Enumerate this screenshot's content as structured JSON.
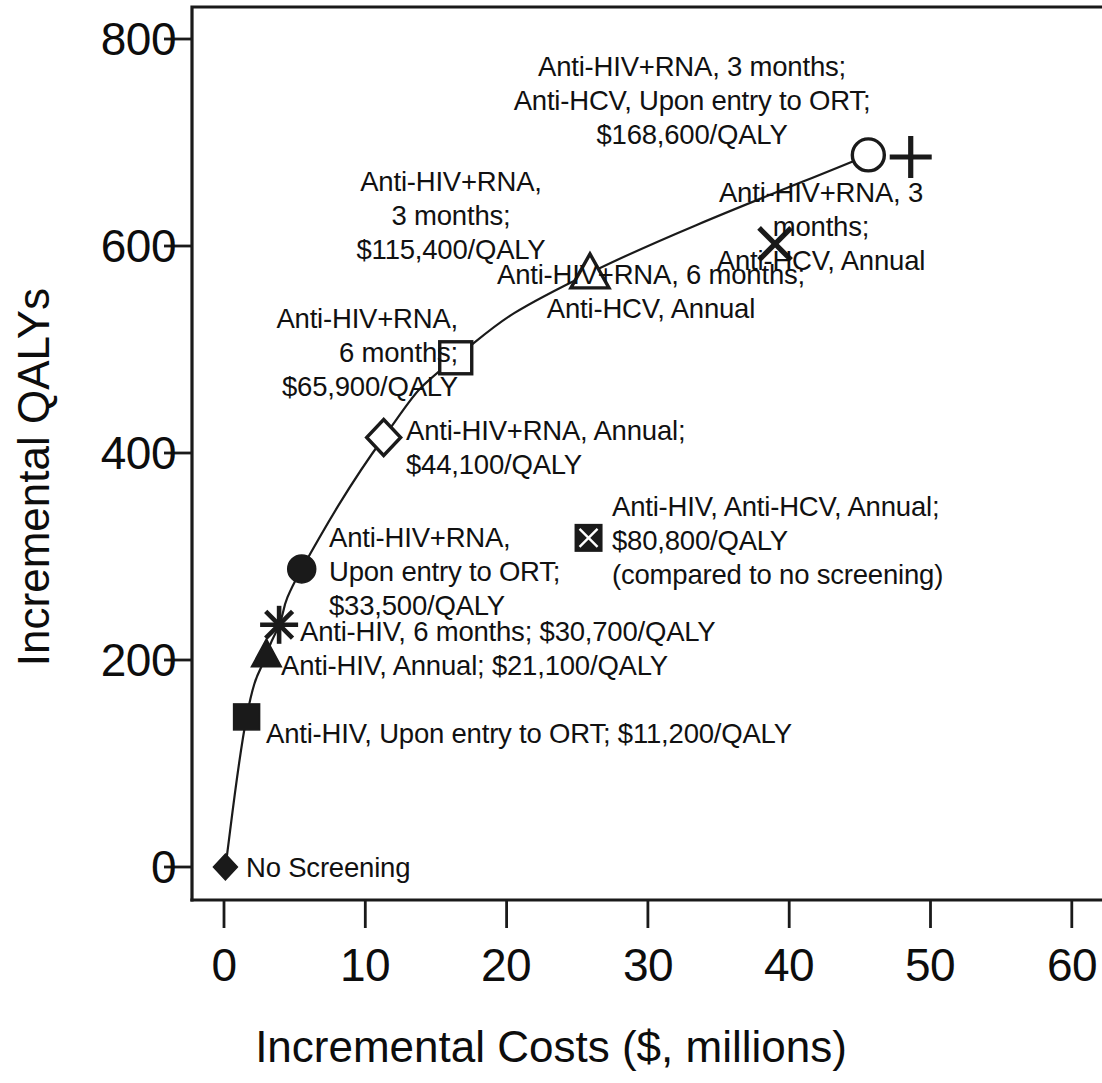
{
  "chart_data": {
    "type": "scatter",
    "title": "",
    "xlabel": "Incremental Costs ($, millions)",
    "ylabel": "Incremental QALYs",
    "xlim": [
      -1.8,
      62.2
    ],
    "ylim": [
      -25,
      838
    ],
    "xticks": [
      "0",
      "10",
      "20",
      "30",
      "40",
      "50",
      "60"
    ],
    "xtick_values": [
      0,
      10,
      20,
      30,
      40,
      50,
      60
    ],
    "yticks": [
      "0",
      "200",
      "400",
      "600",
      "800"
    ],
    "ytick_values": [
      0,
      200,
      400,
      600,
      800
    ],
    "grid": false,
    "legend": false,
    "frontier_note": "Points connected by the line form the efficient frontier; off-frontier strategies are plotted without connection.",
    "points": [
      {
        "id": "no-screening",
        "marker": "filled-diamond",
        "on_frontier": true,
        "x": 0.1,
        "y": 0,
        "strategy": "No Screening",
        "icer": "",
        "label": "No Screening",
        "label_align": "left",
        "label_x": 246,
        "label_y": 851
      },
      {
        "id": "anti-hiv-ort",
        "marker": "filled-square",
        "on_frontier": true,
        "x": 1.6,
        "y": 145,
        "strategy": "Anti-HIV, Upon entry to ORT",
        "icer": "$11,200/QALY",
        "label": "Anti-HIV, Upon entry to ORT; $11,200/QALY",
        "label_align": "left",
        "label_x": 266,
        "label_y": 717
      },
      {
        "id": "anti-hiv-annual",
        "marker": "filled-triangle",
        "on_frontier": true,
        "x": 3.0,
        "y": 205,
        "strategy": "Anti-HIV, Annual",
        "icer": "$21,100/QALY",
        "label": "Anti-HIV, Annual; $21,100/QALY",
        "label_align": "left",
        "label_x": 281,
        "label_y": 649
      },
      {
        "id": "anti-hiv-6mo",
        "marker": "asterisk",
        "on_frontier": true,
        "x": 3.9,
        "y": 234,
        "strategy": "Anti-HIV, 6 months",
        "icer": "$30,700/QALY",
        "label": "Anti-HIV, 6 months; $30,700/QALY",
        "label_align": "left",
        "label_x": 300,
        "label_y": 615
      },
      {
        "id": "anti-hiv-rna-ort",
        "marker": "filled-circle",
        "on_frontier": true,
        "x": 5.5,
        "y": 288,
        "strategy": "Anti-HIV+RNA, Upon entry to ORT",
        "icer": "$33,500/QALY",
        "label": "Anti-HIV+RNA,\nUpon entry to ORT;\n$33,500/QALY",
        "label_align": "left",
        "label_x": 329,
        "label_y": 521
      },
      {
        "id": "anti-hiv-rna-annual",
        "marker": "open-diamond",
        "on_frontier": true,
        "x": 11.3,
        "y": 415,
        "strategy": "Anti-HIV+RNA, Annual",
        "icer": "$44,100/QALY",
        "label": "Anti-HIV+RNA, Annual;\n$44,100/QALY",
        "label_align": "left",
        "label_x": 406,
        "label_y": 414
      },
      {
        "id": "anti-hiv-rna-6mo",
        "marker": "open-square",
        "on_frontier": true,
        "x": 16.4,
        "y": 492,
        "strategy": "Anti-HIV+RNA, 6 months",
        "icer": "$65,900/QALY",
        "label": "Anti-HIV+RNA,\n6 months;\n$65,900/QALY",
        "label_align": "right",
        "label_x": 168,
        "label_y": 302
      },
      {
        "id": "anti-hiv-rna-3mo",
        "marker": "open-triangle",
        "on_frontier": true,
        "x": 25.9,
        "y": 574,
        "strategy": "Anti-HIV+RNA, 3 months",
        "icer": "$115,400/QALY",
        "label": "Anti-HIV+RNA,\n3 months;\n$115,400/QALY",
        "label_align": "center",
        "label_x": 451,
        "label_y": 165
      },
      {
        "id": "anti-hiv-rna-3mo-hcv-ort",
        "marker": "open-circle",
        "on_frontier": true,
        "x": 45.6,
        "y": 688,
        "strategy": "Anti-HIV+RNA, 3 months; Anti-HCV, Upon entry to ORT",
        "icer": "$168,600/QALY",
        "label": "Anti-HIV+RNA, 3 months;\nAnti-HCV, Upon entry to ORT;\n$168,600/QALY",
        "label_align": "center",
        "label_x": 692,
        "label_y": 50
      },
      {
        "id": "anti-hiv-rna-3mo-hcv-annual",
        "marker": "plus",
        "on_frontier": false,
        "x": 48.6,
        "y": 686,
        "strategy": "Anti-HIV+RNA, 3 months; Anti-HCV, Annual",
        "icer": "",
        "label": "Anti-HIV+RNA, 3 months;\nAnti-HCV, Annual",
        "label_align": "center",
        "label_x": 821,
        "label_y": 176
      },
      {
        "id": "anti-hiv-rna-6mo-hcv-annual",
        "marker": "cross-x",
        "on_frontier": false,
        "x": 39.0,
        "y": 602,
        "strategy": "Anti-HIV+RNA, 6 months; Anti-HCV, Annual",
        "icer": "",
        "label": "Anti-HIV+RNA, 6 months;\nAnti-HCV, Annual",
        "label_align": "center",
        "label_x": 651,
        "label_y": 258
      },
      {
        "id": "anti-hiv-anti-hcv-annual",
        "marker": "boxed-x",
        "on_frontier": false,
        "x": 25.8,
        "y": 318,
        "strategy": "Anti-HIV, Anti-HCV, Annual",
        "icer": "$80,800/QALY",
        "label": "Anti-HIV, Anti-HCV, Annual;\n$80,800/QALY\n(compared to no screening)",
        "label_align": "left",
        "label_x": 612,
        "label_y": 490
      }
    ],
    "colors": {
      "axis": "#1a1a1a",
      "line": "#1a1a1a",
      "marker": "#1a1a1a",
      "background": "#ffffff"
    }
  },
  "geometry": {
    "plot_left": 192,
    "plot_right": 1102,
    "plot_top": 7,
    "plot_bottom": 900,
    "x_zero_px": 224,
    "px_per_x_unit": 14.13,
    "y_zero_px": 867,
    "px_per_y_unit": 1.035
  }
}
